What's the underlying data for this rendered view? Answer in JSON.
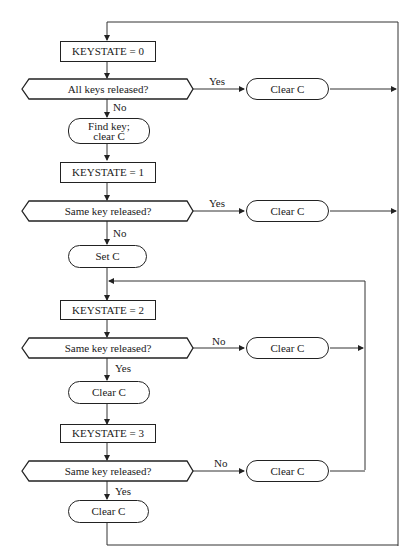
{
  "diagram": {
    "type": "flowchart",
    "nodes": {
      "ks0": "KEYSTATE = 0",
      "dec_all": "All keys released?",
      "find": "Find key;\nclear C",
      "clr_a": "Clear C",
      "ks1": "KEYSTATE = 1",
      "dec_same1": "Same key released?",
      "clr_b": "Clear C",
      "setc": "Set C",
      "ks2": "KEYSTATE = 2",
      "dec_same2": "Same key released?",
      "clr_c": "Clear C",
      "clr_d": "Clear C",
      "ks3": "KEYSTATE = 3",
      "dec_same3": "Same key released?",
      "clr_e": "Clear C",
      "clr_f": "Clear C"
    },
    "edge_labels": {
      "all_yes": "Yes",
      "all_no": "No",
      "same1_yes": "Yes",
      "same1_no": "No",
      "same2_no": "No",
      "same2_yes": "Yes",
      "same3_no": "No",
      "same3_yes": "Yes"
    },
    "colors": {
      "line": "#222222",
      "background": "#ffffff"
    }
  }
}
